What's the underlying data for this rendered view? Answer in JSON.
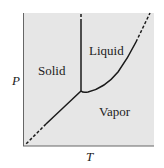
{
  "diagram": {
    "type": "phase-diagram",
    "axes": {
      "x_label": "T",
      "y_label": "P"
    },
    "regions": [
      {
        "id": "solid",
        "label": "Solid"
      },
      {
        "id": "liquid",
        "label": "Liquid"
      },
      {
        "id": "vapor",
        "label": "Vapor"
      }
    ],
    "curves": [
      {
        "id": "fusion",
        "between": [
          "Solid",
          "Liquid"
        ],
        "style": "solid, dashed extension at top"
      },
      {
        "id": "vaporization",
        "between": [
          "Liquid",
          "Vapor"
        ],
        "style": "solid, dashed extension at upper right"
      },
      {
        "id": "sublimation",
        "between": [
          "Solid",
          "Vapor"
        ],
        "style": "solid, dashed extension at lower left"
      }
    ],
    "colors": {
      "plot_background": "#e6e6e6",
      "axis": "#555555",
      "curve": "#1a1a1a"
    }
  }
}
